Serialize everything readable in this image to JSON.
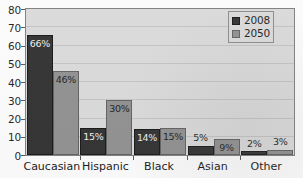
{
  "chart_data": {
    "type": "bar",
    "title": "",
    "subtitle": "",
    "xlabel": "",
    "ylabel": "",
    "categories": [
      "Caucasian",
      "Hispanic",
      "Black",
      "Asian",
      "Other"
    ],
    "series": [
      {
        "name": "2008",
        "color": "#2e2e2e",
        "values": [
          66,
          15,
          14,
          5,
          2
        ],
        "labels": [
          "66%",
          "15%",
          "14%",
          "5%",
          "2%"
        ]
      },
      {
        "name": "2050",
        "color": "#8e8e8e",
        "values": [
          46,
          30,
          15,
          9,
          3
        ],
        "labels": [
          "46%",
          "30%",
          "15%",
          "9%",
          "3%"
        ]
      }
    ],
    "ylim": [
      0,
      80
    ],
    "ytick_values": [
      0,
      10,
      20,
      30,
      40,
      50,
      60,
      70,
      80
    ],
    "ytick_labels": [
      "0",
      "10",
      "20",
      "30",
      "40",
      "50",
      "60",
      "70",
      "80"
    ],
    "grid": true,
    "grid_axis": "y",
    "legend_position": "top-right",
    "legend_entries": [
      "2008",
      "2050"
    ],
    "plot_background": "#d9d9d9",
    "figure_background": "#fbfbfb"
  }
}
